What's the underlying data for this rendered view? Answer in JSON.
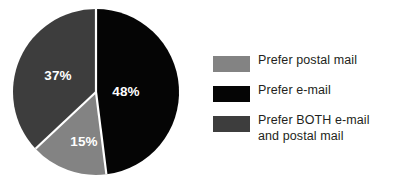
{
  "chart_data": {
    "type": "pie",
    "title": "",
    "categories": [
      "Prefer postal mail",
      "Prefer e-mail",
      "Prefer BOTH e-mail and postal mail"
    ],
    "values": [
      15,
      37,
      48
    ],
    "labels": [
      "15%",
      "48%",
      "37%"
    ],
    "units": "percent",
    "legend_position": "right",
    "grid": false,
    "start_angle_deg": 0,
    "direction": "clockwise",
    "slices": [
      {
        "name": "Prefer e-mail",
        "value": 48,
        "label": "48%",
        "color": "#050505",
        "start_deg": 0,
        "sweep_deg": 172.8,
        "label_x": 126,
        "label_y": 92
      },
      {
        "name": "Prefer postal mail",
        "value": 15,
        "label": "15%",
        "color": "#838383",
        "start_deg": 172.8,
        "sweep_deg": 54.0,
        "label_x": 84,
        "label_y": 142
      },
      {
        "name": "Prefer BOTH e-mail and postal mail",
        "value": 37,
        "label": "37%",
        "color": "#3d3d3d",
        "start_deg": 226.8,
        "sweep_deg": 133.2,
        "label_x": 58,
        "label_y": 76
      }
    ],
    "geometry": {
      "center_x": 96,
      "center_y": 92,
      "radius": 83,
      "separator_color": "#ffffff",
      "separator_width": 2.2
    }
  },
  "legend": {
    "items": [
      {
        "label": "Prefer postal mail",
        "color": "#838383"
      },
      {
        "label": "Prefer e-mail",
        "color": "#050505"
      },
      {
        "label": "Prefer BOTH e-mail\nand postal mail",
        "color": "#3d3d3d"
      }
    ]
  },
  "colors": {
    "background": "#ffffff",
    "text": "#231f20",
    "postal_mail": "#838383",
    "email": "#050505",
    "both": "#3d3d3d",
    "slice_label_text": "#ffffff"
  }
}
